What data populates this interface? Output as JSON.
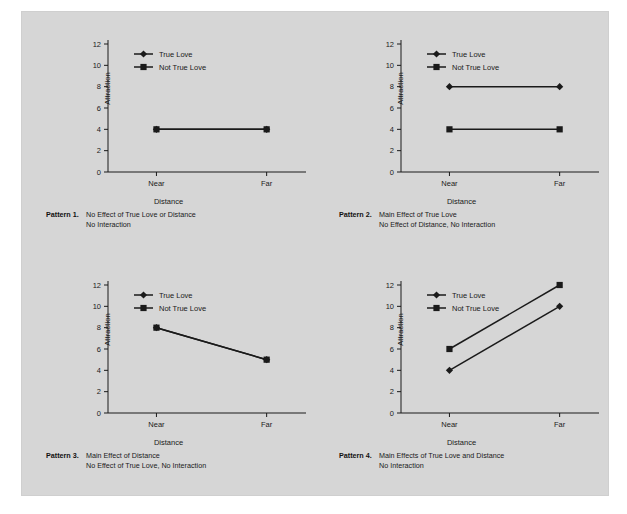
{
  "figure": {
    "background_color": "#d6d6d6",
    "page_color": "#ffffff",
    "ink_color": "#1a1a1a",
    "axis_title_y": "Attraction",
    "axis_title_x": "Distance",
    "categories": [
      "Near",
      "Far"
    ],
    "y_ticks": [
      "0",
      "2",
      "4",
      "6",
      "8",
      "10",
      "12"
    ],
    "legend": [
      {
        "label": "True Love",
        "marker": "diamond-marker"
      },
      {
        "label": "Not True Love",
        "marker": "square-marker"
      }
    ]
  },
  "panels": [
    {
      "id": "pattern-1",
      "caption_label": "Pattern 1.",
      "caption_line1": "No Effect of True Love or Distance",
      "caption_line2": "No Interaction",
      "chart_data": {
        "type": "line",
        "title": "Pattern 1",
        "xlabel": "Distance",
        "ylabel": "Attraction",
        "categories": [
          "Near",
          "Far"
        ],
        "ylim": [
          0,
          12
        ],
        "yticks": [
          0,
          2,
          4,
          6,
          8,
          10,
          12
        ],
        "grid": false,
        "legend_position": "top-left",
        "series": [
          {
            "name": "True Love",
            "marker": "diamond",
            "values": [
              4,
              4
            ]
          },
          {
            "name": "Not True Love",
            "marker": "square",
            "values": [
              4,
              4
            ]
          }
        ],
        "notes": "Both series overlap exactly at 4; only the square marker is visible."
      }
    },
    {
      "id": "pattern-2",
      "caption_label": "Pattern 2.",
      "caption_line1": "Main Effect of True Love",
      "caption_line2": "No Effect of Distance, No Interaction",
      "chart_data": {
        "type": "line",
        "title": "Pattern 2",
        "xlabel": "Distance",
        "ylabel": "Attraction",
        "categories": [
          "Near",
          "Far"
        ],
        "ylim": [
          0,
          12
        ],
        "yticks": [
          0,
          2,
          4,
          6,
          8,
          10,
          12
        ],
        "grid": false,
        "legend_position": "top-left",
        "series": [
          {
            "name": "True Love",
            "marker": "diamond",
            "values": [
              8,
              8
            ]
          },
          {
            "name": "Not True Love",
            "marker": "square",
            "values": [
              4,
              4
            ]
          }
        ]
      }
    },
    {
      "id": "pattern-3",
      "caption_label": "Pattern 3.",
      "caption_line1": "Main Effect of Distance",
      "caption_line2": "No Effect of True Love, No Interaction",
      "chart_data": {
        "type": "line",
        "title": "Pattern 3",
        "xlabel": "Distance",
        "ylabel": "Attraction",
        "categories": [
          "Near",
          "Far"
        ],
        "ylim": [
          0,
          12
        ],
        "yticks": [
          0,
          2,
          4,
          6,
          8,
          10,
          12
        ],
        "grid": false,
        "legend_position": "top-left",
        "series": [
          {
            "name": "True Love",
            "marker": "diamond",
            "values": [
              8,
              5
            ]
          },
          {
            "name": "Not True Love",
            "marker": "square",
            "values": [
              8,
              5
            ]
          }
        ],
        "notes": "Both series overlap exactly; only the square marker is visible."
      }
    },
    {
      "id": "pattern-4",
      "caption_label": "Pattern 4.",
      "caption_line1": "Main Effects of True Love and Distance",
      "caption_line2": "No Interaction",
      "chart_data": {
        "type": "line",
        "title": "Pattern 4",
        "xlabel": "Distance",
        "ylabel": "Attraction",
        "categories": [
          "Near",
          "Far"
        ],
        "ylim": [
          0,
          12
        ],
        "yticks": [
          0,
          2,
          4,
          6,
          8,
          10,
          12
        ],
        "grid": false,
        "legend_position": "top-left",
        "series": [
          {
            "name": "True Love",
            "marker": "diamond",
            "values": [
              4,
              10
            ]
          },
          {
            "name": "Not True Love",
            "marker": "square",
            "values": [
              6,
              12
            ]
          }
        ]
      }
    }
  ]
}
